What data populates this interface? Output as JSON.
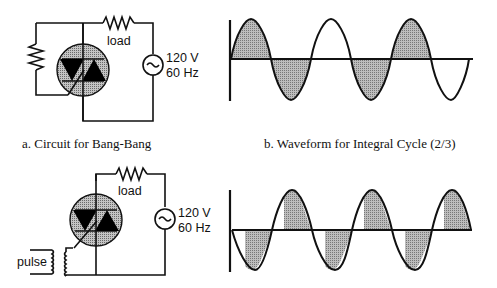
{
  "figure": {
    "panel_a": {
      "caption": "a. Circuit for Bang-Bang",
      "load_label": "load",
      "source_voltage": "120 V",
      "source_frequency": "60 Hz",
      "source_symbol": "~"
    },
    "panel_b": {
      "caption": "b. Waveform for Integral Cycle (2/3)"
    },
    "panel_c": {
      "load_label": "load",
      "source_voltage": "120 V",
      "source_frequency": "60 Hz",
      "pulse_label": "pulse",
      "source_symbol": "~"
    },
    "panel_d": {}
  },
  "colors": {
    "line": "#111111",
    "shade": "#9a9a9a",
    "triac_disc": "#b8b8b8"
  }
}
